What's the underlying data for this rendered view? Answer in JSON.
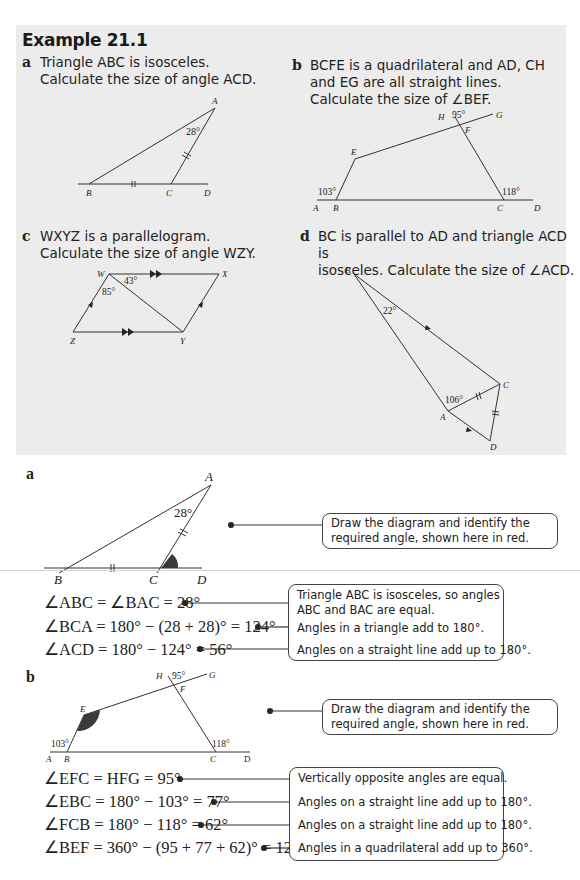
{
  "example": {
    "title": "Example 21.1",
    "questions": [
      {
        "label": "a",
        "lines": [
          "Triangle ABC is isosceles.",
          "Calculate the size of angle ACD."
        ],
        "diagram": {
          "points": [
            "A",
            "B",
            "C",
            "D"
          ],
          "angle": "28°"
        }
      },
      {
        "label": "b",
        "lines": [
          "BCFE is a quadrilateral and AD, CH",
          "and EG are all straight lines.",
          "Calculate the size of ∠BEF."
        ],
        "diagram": {
          "points": [
            "A",
            "B",
            "C",
            "D",
            "E",
            "F",
            "G",
            "H"
          ],
          "angles": [
            "95°",
            "103°",
            "118°"
          ]
        }
      },
      {
        "label": "c",
        "lines": [
          "WXYZ is a parallelogram.",
          "Calculate the size of angle WZY."
        ],
        "diagram": {
          "points": [
            "W",
            "X",
            "Y",
            "Z"
          ],
          "angles": [
            "43°",
            "85°"
          ]
        }
      },
      {
        "label": "d",
        "lines": [
          "BC is parallel to AD and triangle ACD is",
          "isosceles. Calculate the size of ∠ACD."
        ],
        "diagram": {
          "points": [
            "A",
            "B",
            "C",
            "D"
          ],
          "angles": [
            "22°",
            "106°"
          ]
        }
      }
    ]
  },
  "solutions": {
    "a": {
      "label": "a",
      "diagram": {
        "points": [
          "A",
          "B",
          "C",
          "D"
        ],
        "angle": "28°"
      },
      "intro_note": "Draw the diagram and identify the required angle, shown here in red.",
      "steps": [
        {
          "eq": "∠ABC = ∠BAC = 28°",
          "note": "Triangle ABC is isosceles, so angles ABC and BAC are equal."
        },
        {
          "eq": "∠BCA = 180° − (28 + 28)° = 124°",
          "note": "Angles in a triangle add to 180°."
        },
        {
          "eq": "∠ACD = 180° − 124° = 56°",
          "note": "Angles on a straight line add up to 180°."
        }
      ]
    },
    "b": {
      "label": "b",
      "diagram": {
        "points": [
          "A",
          "B",
          "C",
          "D",
          "E",
          "F",
          "G",
          "H"
        ],
        "angles": [
          "95°",
          "103°",
          "118°"
        ]
      },
      "intro_note": "Draw the diagram and identify the required angle, shown here in red.",
      "steps": [
        {
          "eq": "∠EFC = HFG = 95°",
          "note": "Vertically opposite angles are equal."
        },
        {
          "eq": "∠EBC = 180° − 103° = 77°",
          "note": "Angles on a straight line add up to 180°."
        },
        {
          "eq": "∠FCB = 180° − 118° = 62°",
          "note": "Angles on a straight line add up to 180°."
        },
        {
          "eq": "∠BEF = 360° − (95 + 77 + 62)° = 126°",
          "note": "Angles in a quadrilateral add up to 360°."
        }
      ]
    }
  },
  "colors": {
    "panel": "#ececec",
    "highlight_angle": "#3a3a3a",
    "line": "#333333"
  }
}
